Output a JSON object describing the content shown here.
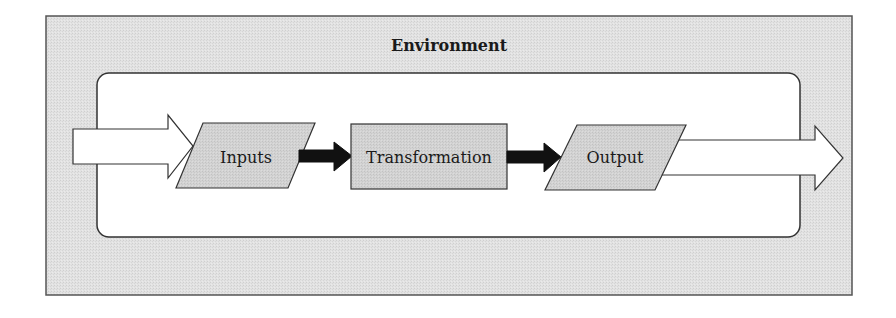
{
  "diagram": {
    "title": "Environment",
    "nodes": [
      {
        "id": "inputs",
        "label": "Inputs",
        "shape": "parallelogram"
      },
      {
        "id": "transformation",
        "label": "Transformation",
        "shape": "rectangle"
      },
      {
        "id": "output",
        "label": "Output",
        "shape": "parallelogram"
      }
    ],
    "edges": [
      {
        "from": "external",
        "to": "inputs",
        "style": "hollow-block-arrow"
      },
      {
        "from": "inputs",
        "to": "transformation",
        "style": "solid-black-arrow"
      },
      {
        "from": "transformation",
        "to": "output",
        "style": "solid-black-arrow"
      },
      {
        "from": "output",
        "to": "external",
        "style": "hollow-block-arrow"
      }
    ],
    "colors": {
      "environment_fill": "#dedede",
      "system_fill": "#ffffff",
      "node_fill": "#d2d2d2",
      "stroke": "#333333",
      "connector": "#111111"
    }
  }
}
